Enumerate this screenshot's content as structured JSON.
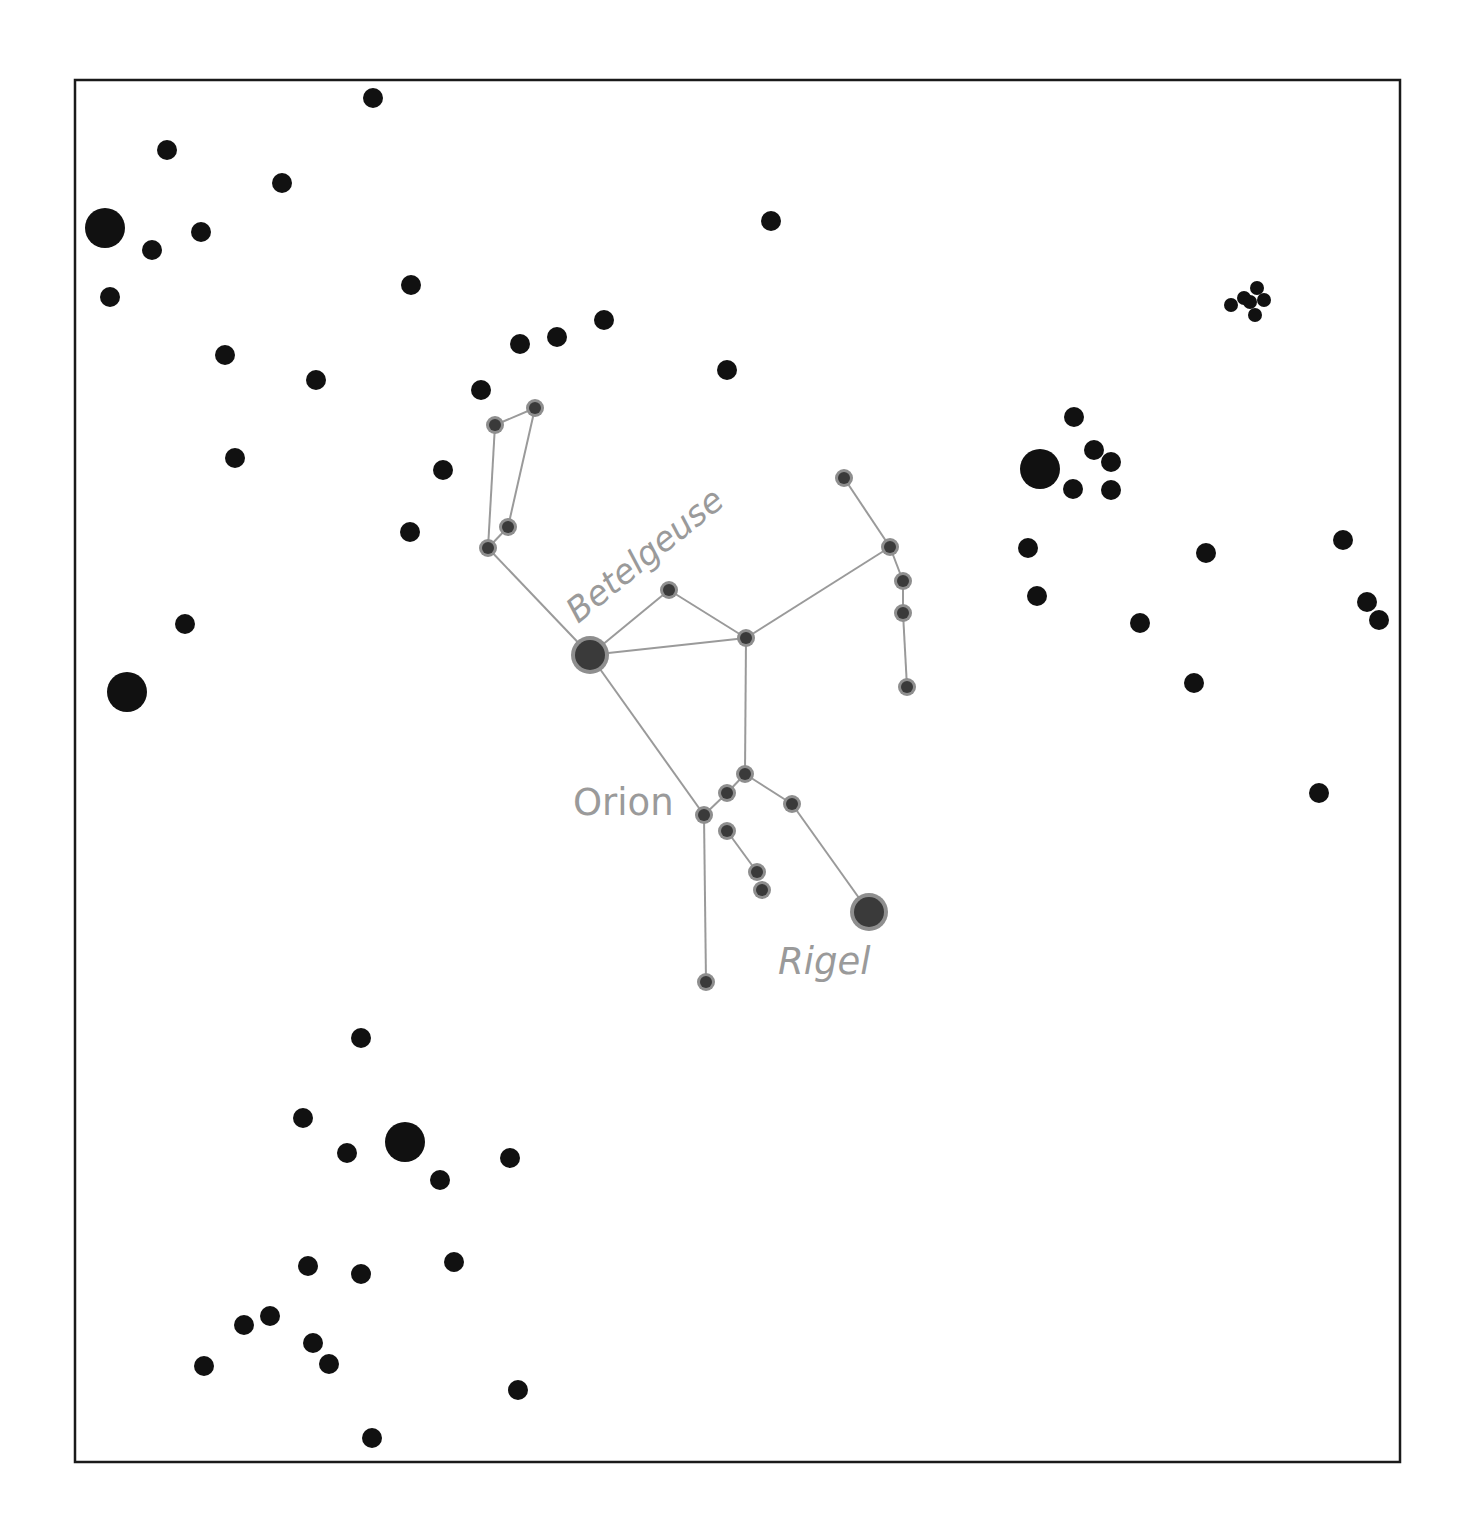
{
  "colors": {
    "background": "#ffffff",
    "frame": "#1a1a1a",
    "field_star": "#111111",
    "constellation_star_core": "#3a3a3a",
    "constellation_star_halo": "#8e8e8e",
    "constellation_line": "#9a9a9a",
    "label": "#9a9a9a"
  },
  "frame": {
    "x": 75,
    "y": 80,
    "width": 1325,
    "height": 1382
  },
  "labels": {
    "constellation": "Orion",
    "betelgeuse": "Betelgeuse",
    "rigel": "Rigel"
  },
  "constellation": {
    "name": "Orion",
    "stars": [
      {
        "id": "betelgeuse",
        "x": 590,
        "y": 655,
        "r": 19,
        "name": "Betelgeuse"
      },
      {
        "id": "rigel",
        "x": 869,
        "y": 912,
        "r": 19,
        "name": "Rigel"
      },
      {
        "id": "c1",
        "x": 495,
        "y": 425,
        "r": 9
      },
      {
        "id": "c2",
        "x": 535,
        "y": 408,
        "r": 9
      },
      {
        "id": "c3",
        "x": 508,
        "y": 527,
        "r": 9
      },
      {
        "id": "c4",
        "x": 488,
        "y": 548,
        "r": 9
      },
      {
        "id": "c5",
        "x": 669,
        "y": 590,
        "r": 9
      },
      {
        "id": "c6",
        "x": 746,
        "y": 638,
        "r": 9
      },
      {
        "id": "c7",
        "x": 844,
        "y": 478,
        "r": 9
      },
      {
        "id": "c8",
        "x": 890,
        "y": 547,
        "r": 9
      },
      {
        "id": "c9",
        "x": 903,
        "y": 581,
        "r": 9
      },
      {
        "id": "c10",
        "x": 903,
        "y": 613,
        "r": 9
      },
      {
        "id": "c11",
        "x": 907,
        "y": 687,
        "r": 9
      },
      {
        "id": "c12",
        "x": 745,
        "y": 774,
        "r": 9
      },
      {
        "id": "c13",
        "x": 727,
        "y": 793,
        "r": 9
      },
      {
        "id": "c14",
        "x": 704,
        "y": 815,
        "r": 9
      },
      {
        "id": "c15",
        "x": 792,
        "y": 804,
        "r": 9
      },
      {
        "id": "c16",
        "x": 727,
        "y": 831,
        "r": 9
      },
      {
        "id": "c17",
        "x": 757,
        "y": 872,
        "r": 9
      },
      {
        "id": "c18",
        "x": 762,
        "y": 890,
        "r": 9
      },
      {
        "id": "c19",
        "x": 706,
        "y": 982,
        "r": 9
      }
    ],
    "lines": [
      [
        "c1",
        "c2"
      ],
      [
        "c1",
        "c4"
      ],
      [
        "c2",
        "c3"
      ],
      [
        "c3",
        "c4"
      ],
      [
        "c4",
        "betelgeuse"
      ],
      [
        "betelgeuse",
        "c5"
      ],
      [
        "c5",
        "c6"
      ],
      [
        "betelgeuse",
        "c6"
      ],
      [
        "c6",
        "c8"
      ],
      [
        "c7",
        "c8"
      ],
      [
        "c8",
        "c9"
      ],
      [
        "c9",
        "c10"
      ],
      [
        "c10",
        "c11"
      ],
      [
        "c6",
        "c12"
      ],
      [
        "betelgeuse",
        "c14"
      ],
      [
        "c14",
        "c13"
      ],
      [
        "c13",
        "c12"
      ],
      [
        "c12",
        "c15"
      ],
      [
        "c15",
        "rigel"
      ],
      [
        "c14",
        "c19"
      ],
      [
        "c16",
        "c17"
      ]
    ]
  },
  "field_stars": [
    {
      "x": 373,
      "y": 98,
      "r": 10
    },
    {
      "x": 167,
      "y": 150,
      "r": 10
    },
    {
      "x": 282,
      "y": 183,
      "r": 10
    },
    {
      "x": 105,
      "y": 228,
      "r": 20
    },
    {
      "x": 201,
      "y": 232,
      "r": 10
    },
    {
      "x": 152,
      "y": 250,
      "r": 10
    },
    {
      "x": 110,
      "y": 297,
      "r": 10
    },
    {
      "x": 771,
      "y": 221,
      "r": 10
    },
    {
      "x": 411,
      "y": 285,
      "r": 10
    },
    {
      "x": 225,
      "y": 355,
      "r": 10
    },
    {
      "x": 316,
      "y": 380,
      "r": 10
    },
    {
      "x": 520,
      "y": 344,
      "r": 10
    },
    {
      "x": 557,
      "y": 337,
      "r": 10
    },
    {
      "x": 604,
      "y": 320,
      "r": 10
    },
    {
      "x": 727,
      "y": 370,
      "r": 10
    },
    {
      "x": 481,
      "y": 390,
      "r": 10
    },
    {
      "x": 235,
      "y": 458,
      "r": 10
    },
    {
      "x": 443,
      "y": 470,
      "r": 10
    },
    {
      "x": 410,
      "y": 532,
      "r": 10
    },
    {
      "x": 185,
      "y": 624,
      "r": 10
    },
    {
      "x": 127,
      "y": 692,
      "r": 20
    },
    {
      "x": 1231,
      "y": 305,
      "r": 7
    },
    {
      "x": 1244,
      "y": 298,
      "r": 7
    },
    {
      "x": 1257,
      "y": 288,
      "r": 7
    },
    {
      "x": 1264,
      "y": 300,
      "r": 7
    },
    {
      "x": 1250,
      "y": 302,
      "r": 7
    },
    {
      "x": 1255,
      "y": 315,
      "r": 7
    },
    {
      "x": 1074,
      "y": 417,
      "r": 10
    },
    {
      "x": 1040,
      "y": 469,
      "r": 20
    },
    {
      "x": 1094,
      "y": 450,
      "r": 10
    },
    {
      "x": 1111,
      "y": 462,
      "r": 10
    },
    {
      "x": 1073,
      "y": 489,
      "r": 10
    },
    {
      "x": 1111,
      "y": 490,
      "r": 10
    },
    {
      "x": 1028,
      "y": 548,
      "r": 10
    },
    {
      "x": 1206,
      "y": 553,
      "r": 10
    },
    {
      "x": 1343,
      "y": 540,
      "r": 10
    },
    {
      "x": 1037,
      "y": 596,
      "r": 10
    },
    {
      "x": 1140,
      "y": 623,
      "r": 10
    },
    {
      "x": 1367,
      "y": 602,
      "r": 10
    },
    {
      "x": 1379,
      "y": 620,
      "r": 10
    },
    {
      "x": 1194,
      "y": 683,
      "r": 10
    },
    {
      "x": 1319,
      "y": 793,
      "r": 10
    },
    {
      "x": 361,
      "y": 1038,
      "r": 10
    },
    {
      "x": 303,
      "y": 1118,
      "r": 10
    },
    {
      "x": 405,
      "y": 1142,
      "r": 20
    },
    {
      "x": 347,
      "y": 1153,
      "r": 10
    },
    {
      "x": 440,
      "y": 1180,
      "r": 10
    },
    {
      "x": 510,
      "y": 1158,
      "r": 10
    },
    {
      "x": 308,
      "y": 1266,
      "r": 10
    },
    {
      "x": 361,
      "y": 1274,
      "r": 10
    },
    {
      "x": 454,
      "y": 1262,
      "r": 10
    },
    {
      "x": 244,
      "y": 1325,
      "r": 10
    },
    {
      "x": 270,
      "y": 1316,
      "r": 10
    },
    {
      "x": 313,
      "y": 1343,
      "r": 10
    },
    {
      "x": 329,
      "y": 1364,
      "r": 10
    },
    {
      "x": 204,
      "y": 1366,
      "r": 10
    },
    {
      "x": 518,
      "y": 1390,
      "r": 10
    },
    {
      "x": 372,
      "y": 1438,
      "r": 10
    }
  ]
}
